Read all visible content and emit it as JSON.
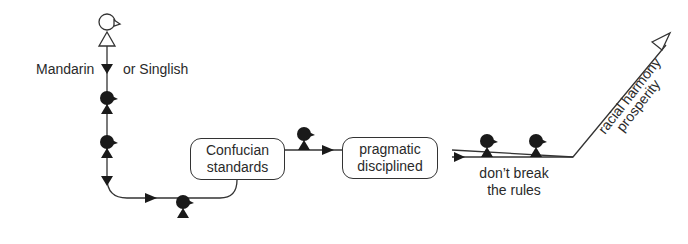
{
  "diagram": {
    "start_label_left": "Mandarin",
    "start_label_right": "or Singlish",
    "box1": {
      "line1": "Confucian",
      "line2": "standards"
    },
    "box2": {
      "line1": "pragmatic",
      "line2": "disciplined"
    },
    "bottom_label": {
      "line1": "don’t break",
      "line2": "the rules"
    },
    "arrow_labels": {
      "line1": "racial harmony",
      "line2": "prosperity"
    },
    "figures": [
      "open-figure",
      "filled-figure",
      "filled-figure",
      "filled-figure",
      "filled-figure",
      "filled-figure",
      "filled-figure"
    ],
    "colors": {
      "line": "#333333",
      "figure": "#1a1a1a",
      "background": "#ffffff"
    }
  }
}
